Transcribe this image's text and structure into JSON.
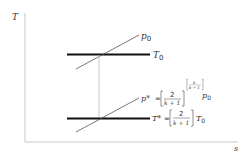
{
  "diagram": {
    "axes": {
      "y_label": "T",
      "x_label": "s"
    },
    "upper_isobar_label": "p",
    "upper_isobar_sub": "0",
    "upper_isotherm_label": "T",
    "upper_isotherm_sub": "0",
    "lower_isobar": {
      "lhs": "p*",
      "eq": "=",
      "num": "2",
      "den": "k + 1",
      "exp_num": "k",
      "exp_den": "k − 1",
      "rhs": "p",
      "rhs_sub": "0"
    },
    "lower_isotherm": {
      "lhs": "T*",
      "eq": "=",
      "num": "2",
      "den": "k + 1",
      "rhs": "T",
      "rhs_sub": "0"
    }
  }
}
